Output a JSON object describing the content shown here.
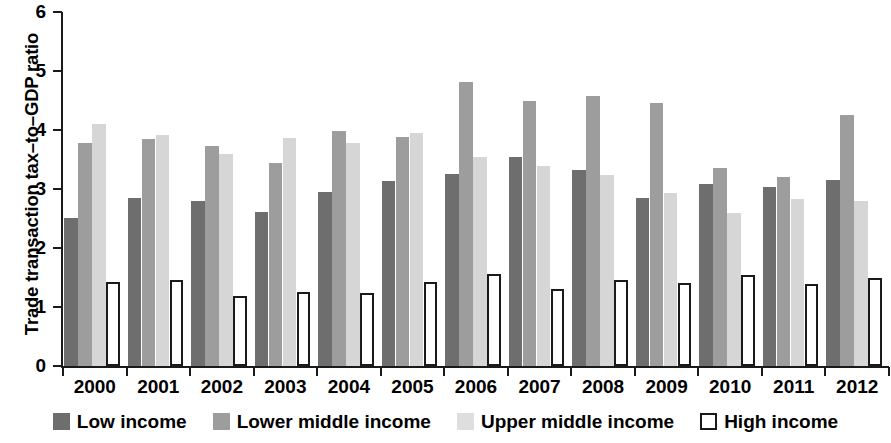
{
  "chart_data": {
    "type": "bar",
    "title": "",
    "xlabel": "",
    "ylabel": "Trade transaction tax–to–GDP ratio",
    "ylim": [
      0,
      6
    ],
    "ytick_labels": [
      "6",
      "5",
      "4",
      "3",
      "2",
      "1",
      "0"
    ],
    "ytick_values": [
      6,
      5,
      4,
      3,
      2,
      1,
      0
    ],
    "grid": false,
    "legend_position": "bottom",
    "categories": [
      "2000",
      "2001",
      "2002",
      "2003",
      "2004",
      "2005",
      "2006",
      "2007",
      "2008",
      "2009",
      "2010",
      "2011",
      "2012"
    ],
    "series": [
      {
        "name": "Low income",
        "color": "#6e6e6e",
        "values": [
          2.51,
          2.85,
          2.8,
          2.61,
          2.95,
          3.13,
          3.25,
          3.54,
          3.32,
          2.84,
          3.08,
          3.03,
          3.15
        ]
      },
      {
        "name": "Lower middle income",
        "color": "#9d9d9d",
        "values": [
          3.78,
          3.85,
          3.73,
          3.44,
          3.99,
          3.89,
          4.81,
          4.49,
          4.58,
          4.45,
          3.36,
          3.2,
          4.26
        ]
      },
      {
        "name": "Upper middle income",
        "color": "#d6d6d6",
        "values": [
          4.1,
          3.91,
          3.6,
          3.86,
          3.78,
          3.95,
          3.54,
          3.39,
          3.24,
          2.93,
          2.6,
          2.83,
          2.8
        ]
      },
      {
        "name": "High income",
        "color": "#ffffff",
        "values": [
          1.42,
          1.46,
          1.18,
          1.26,
          1.24,
          1.42,
          1.56,
          1.31,
          1.46,
          1.41,
          1.54,
          1.39,
          1.5
        ]
      }
    ]
  },
  "legend": {
    "items": [
      {
        "label": "Low income",
        "swatch": "swatch-low-income",
        "class": "sw-low"
      },
      {
        "label": "Lower middle income",
        "swatch": "swatch-lower-middle-income",
        "class": "sw-lowmid"
      },
      {
        "label": "Upper middle income",
        "swatch": "swatch-upper-middle-income",
        "class": "sw-uppmid"
      },
      {
        "label": "High income",
        "swatch": "swatch-high-income",
        "class": "sw-high"
      }
    ]
  }
}
